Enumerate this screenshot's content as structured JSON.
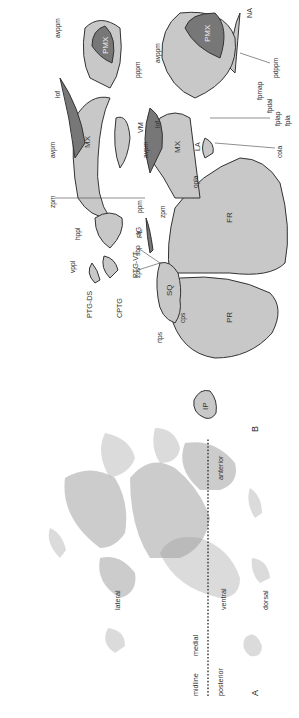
{
  "figure": {
    "orientation": "rotated-90-ccw",
    "panels": [
      {
        "id": "A",
        "label": "A",
        "description": "Stained histological/CT surface views of skull elements",
        "orientation_labels": {
          "dorsal": "dorsal",
          "ventral": "ventral",
          "posterior": "posterior",
          "anterior": "anterior",
          "midline": "midline",
          "medial": "medial",
          "lateral": "lateral"
        }
      },
      {
        "id": "B",
        "label": "B",
        "description": "Schematic interpretation of skull bones",
        "bones": {
          "FR": "FR",
          "PR": "PR",
          "IP": "IP",
          "SQ": "SQ",
          "NA": "NA",
          "PMX_top": "PMX",
          "PMX_bottom": "PMX",
          "MX_top": "MX",
          "MX_bottom": "MX",
          "LA": "LA",
          "JG": "JG",
          "VM": "VM",
          "PL": "PL",
          "PTG_VT": "PTG-VT",
          "PTG_DS": "PTG-DS",
          "CPTG": "CPTG"
        },
        "annotations_top": [
          "pdppm",
          "fpmap",
          "fpdal",
          "fplap",
          "fpla",
          "cola",
          "opla",
          "zpm",
          "sbp",
          "zps",
          "cps",
          "rtps",
          "lof",
          "avppm",
          "avpm"
        ],
        "annotations_bottom": [
          "pppm",
          "avppm",
          "lof",
          "avpm",
          "zpm",
          "ppm",
          "hppl",
          "vppl"
        ]
      }
    ]
  }
}
